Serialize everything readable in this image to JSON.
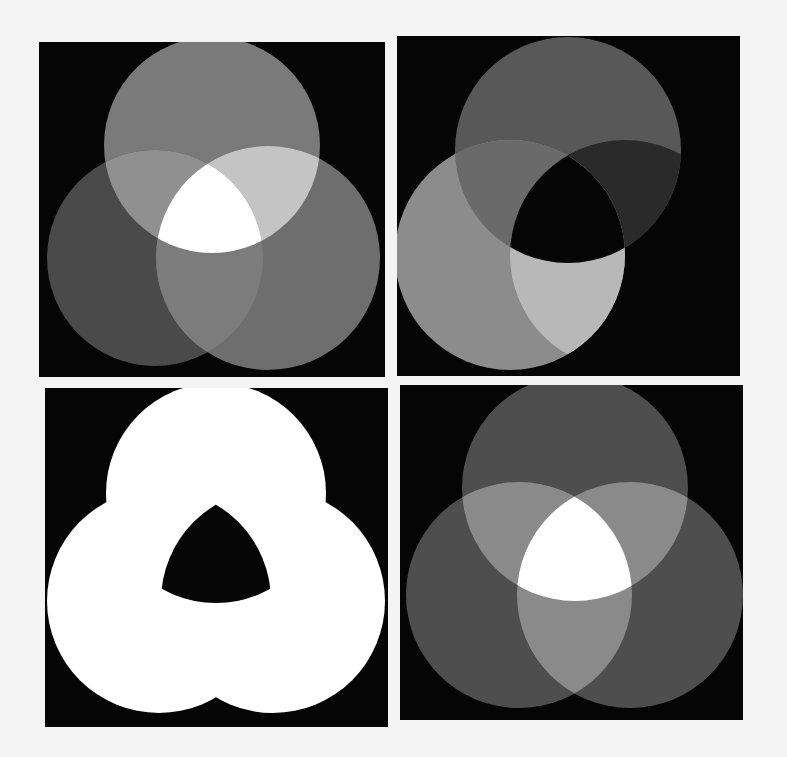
{
  "figure": {
    "layout": "2x2 grid",
    "background": "#f4f4f4",
    "panel_background": "#050505",
    "panels": [
      {
        "id": "top-left",
        "description": "Three overlapping circles, additive mixing; center overlap white",
        "circles": [
          {
            "name": "top",
            "cx": 173,
            "cy": 103,
            "r": 108,
            "fill": "#7a7a7a"
          },
          {
            "name": "left",
            "cx": 116,
            "cy": 216,
            "r": 108,
            "fill": "#4a4a4a"
          },
          {
            "name": "right",
            "cx": 229,
            "cy": 216,
            "r": 112,
            "fill": "#6e6e6e"
          }
        ],
        "regions": {
          "top_left_overlap": "#909090",
          "top_right_overlap": "#c4c4c4",
          "left_right_overlap": "#7c7c7c",
          "center": "#ffffff"
        }
      },
      {
        "id": "top-right",
        "description": "Two visible circles over black; third circle black; center overlap black",
        "circles": [
          {
            "name": "top",
            "cx": 171,
            "cy": 114,
            "r": 113,
            "fill": "#585858"
          },
          {
            "name": "left",
            "cx": 113,
            "cy": 219,
            "r": 115,
            "fill": "#8c8c8c"
          },
          {
            "name": "right",
            "cx": 228,
            "cy": 219,
            "r": 115,
            "fill": "#050505"
          }
        ],
        "regions": {
          "top_left_overlap": "#6a6a6a",
          "top_right_overlap": "#2a2a2a",
          "left_right_overlap": "#b8b8b8",
          "center": "#050505"
        }
      },
      {
        "id": "bottom-left",
        "description": "Union of three circles white; central Reuleaux triangle black",
        "circles": [
          {
            "name": "top",
            "cx": 171,
            "cy": 105,
            "r": 110,
            "fill": "#ffffff"
          },
          {
            "name": "left",
            "cx": 114,
            "cy": 213,
            "r": 112,
            "fill": "#ffffff"
          },
          {
            "name": "right",
            "cx": 228,
            "cy": 213,
            "r": 112,
            "fill": "#ffffff"
          }
        ],
        "regions": {
          "center": "#050505"
        }
      },
      {
        "id": "bottom-right",
        "description": "Three overlapping circles, equal gray; pairwise overlaps lighter; center white",
        "circles": [
          {
            "name": "top",
            "cx": 175,
            "cy": 103,
            "r": 113,
            "fill": "#4e4e4e"
          },
          {
            "name": "left",
            "cx": 119,
            "cy": 210,
            "r": 113,
            "fill": "#4e4e4e"
          },
          {
            "name": "right",
            "cx": 230,
            "cy": 210,
            "r": 113,
            "fill": "#4e4e4e"
          }
        ],
        "regions": {
          "top_left_overlap": "#8a8a8a",
          "top_right_overlap": "#8a8a8a",
          "left_right_overlap": "#8a8a8a",
          "center": "#ffffff"
        }
      }
    ]
  }
}
